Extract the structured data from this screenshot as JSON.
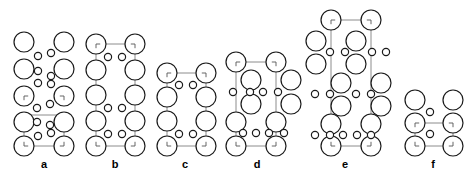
{
  "figure": {
    "kind": "crystal-structure-panels",
    "background_color": "#ffffff",
    "atom_outline_color": "#1a1a1a",
    "atom_fill_color": "#ffffff",
    "cell_edge_color": "#8c8c8c",
    "large_atom_radius": 10,
    "medium_atom_radius": 9,
    "small_atom_radius": 3.6,
    "corner_tick_color": "#555555",
    "panels": [
      {
        "id": "a",
        "label": "a",
        "label_x": 44,
        "label_y": 168,
        "cell_corners": [
          [
            24,
            115
          ],
          [
            64,
            115
          ],
          [
            24,
            146
          ],
          [
            64,
            146
          ]
        ],
        "cell_edges": [
          [
            24,
            115,
            64,
            115
          ],
          [
            24,
            146,
            64,
            146
          ],
          [
            24,
            115,
            24,
            146
          ],
          [
            64,
            115,
            64,
            146
          ]
        ],
        "large_atoms": [
          [
            24,
            42
          ],
          [
            64,
            42
          ],
          [
            24,
            69
          ],
          [
            64,
            69
          ],
          [
            24,
            96
          ],
          [
            64,
            96
          ],
          [
            24,
            122
          ],
          [
            64,
            122
          ],
          [
            24,
            146
          ],
          [
            64,
            146
          ]
        ],
        "small_atoms": [
          [
            38,
            56
          ],
          [
            51,
            53
          ],
          [
            38,
            71
          ],
          [
            51,
            76
          ],
          [
            38,
            83
          ],
          [
            51,
            84
          ],
          [
            37,
            108
          ],
          [
            50,
            104
          ],
          [
            37,
            122
          ],
          [
            50,
            125
          ],
          [
            38,
            136
          ],
          [
            51,
            133
          ]
        ],
        "corner_atoms": [
          [
            24,
            96
          ],
          [
            64,
            96
          ],
          [
            24,
            146
          ],
          [
            64,
            146
          ]
        ]
      },
      {
        "id": "b",
        "label": "b",
        "label_x": 115,
        "label_y": 168,
        "cell_corners": [
          [
            96,
            44
          ],
          [
            135,
            44
          ],
          [
            96,
            146
          ],
          [
            135,
            146
          ]
        ],
        "cell_edges": [
          [
            96,
            44,
            135,
            44
          ],
          [
            96,
            146,
            135,
            146
          ],
          [
            96,
            44,
            96,
            146
          ],
          [
            135,
            44,
            135,
            146
          ]
        ],
        "large_atoms": [
          [
            96,
            44
          ],
          [
            135,
            44
          ],
          [
            96,
            70
          ],
          [
            135,
            70
          ],
          [
            96,
            95
          ],
          [
            135,
            95
          ],
          [
            96,
            121
          ],
          [
            135,
            121
          ],
          [
            96,
            146
          ],
          [
            135,
            146
          ]
        ],
        "small_atoms": [
          [
            108,
            57
          ],
          [
            122,
            57
          ],
          [
            108,
            108
          ],
          [
            122,
            108
          ],
          [
            108,
            134
          ],
          [
            122,
            134
          ]
        ],
        "corner_atoms": [
          [
            96,
            44
          ],
          [
            135,
            44
          ],
          [
            96,
            146
          ],
          [
            135,
            146
          ]
        ]
      },
      {
        "id": "c",
        "label": "c",
        "label_x": 185,
        "label_y": 168,
        "cell_corners": [
          [
            167,
            73
          ],
          [
            206,
            73
          ],
          [
            167,
            146
          ],
          [
            206,
            146
          ]
        ],
        "cell_edges": [
          [
            167,
            73,
            206,
            73
          ],
          [
            167,
            146,
            206,
            146
          ],
          [
            167,
            73,
            167,
            146
          ],
          [
            206,
            73,
            206,
            146
          ]
        ],
        "large_atoms": [
          [
            167,
            73
          ],
          [
            206,
            73
          ],
          [
            167,
            97
          ],
          [
            206,
            97
          ],
          [
            167,
            121
          ],
          [
            206,
            121
          ],
          [
            167,
            146
          ],
          [
            206,
            146
          ]
        ],
        "small_atoms": [
          [
            179,
            85
          ],
          [
            193,
            85
          ],
          [
            179,
            134
          ],
          [
            193,
            134
          ]
        ],
        "corner_atoms": [
          [
            167,
            73
          ],
          [
            206,
            73
          ],
          [
            167,
            146
          ],
          [
            206,
            146
          ]
        ]
      },
      {
        "id": "d",
        "label": "d",
        "label_x": 257,
        "label_y": 168,
        "cell_corners": [
          [
            236,
            62
          ],
          [
            276,
            62
          ],
          [
            236,
            146
          ],
          [
            276,
            146
          ]
        ],
        "cell_edges": [
          [
            236,
            62,
            276,
            62
          ],
          [
            236,
            146,
            276,
            146
          ],
          [
            236,
            62,
            236,
            146
          ],
          [
            276,
            62,
            276,
            146
          ]
        ],
        "large_atoms": [
          [
            236,
            62
          ],
          [
            276,
            62
          ],
          [
            251,
            80
          ],
          [
            291,
            80
          ],
          [
            251,
            104
          ],
          [
            291,
            104
          ],
          [
            236,
            122
          ],
          [
            276,
            122
          ],
          [
            236,
            146
          ],
          [
            276,
            146
          ]
        ],
        "small_atoms": [
          [
            233,
            92
          ],
          [
            250,
            92
          ],
          [
            263,
            92
          ],
          [
            278,
            92
          ],
          [
            243,
            133
          ],
          [
            256,
            133
          ],
          [
            269,
            133
          ],
          [
            284,
            133
          ]
        ],
        "corner_atoms": [
          [
            236,
            62
          ],
          [
            276,
            62
          ],
          [
            236,
            146
          ],
          [
            276,
            146
          ]
        ]
      },
      {
        "id": "e",
        "label": "e",
        "label_x": 345,
        "label_y": 168,
        "cell_corners": [
          [
            331,
            20
          ],
          [
            371,
            20
          ],
          [
            331,
            146
          ],
          [
            371,
            146
          ]
        ],
        "cell_edges": [
          [
            331,
            20,
            371,
            20
          ],
          [
            331,
            146,
            371,
            146
          ],
          [
            331,
            20,
            331,
            146
          ],
          [
            371,
            20,
            371,
            146
          ]
        ],
        "large_atoms": [
          [
            331,
            20
          ],
          [
            371,
            20
          ],
          [
            316,
            41
          ],
          [
            356,
            41
          ],
          [
            316,
            64
          ],
          [
            356,
            64
          ],
          [
            341,
            83
          ],
          [
            381,
            83
          ],
          [
            341,
            106
          ],
          [
            381,
            106
          ],
          [
            331,
            124
          ],
          [
            371,
            124
          ],
          [
            331,
            146
          ],
          [
            371,
            146
          ]
        ],
        "small_atoms": [
          [
            330,
            52
          ],
          [
            345,
            52
          ],
          [
            372,
            52
          ],
          [
            386,
            52
          ],
          [
            315,
            94
          ],
          [
            330,
            94
          ],
          [
            356,
            94
          ],
          [
            371,
            94
          ],
          [
            315,
            135
          ],
          [
            330,
            135
          ],
          [
            343,
            135
          ],
          [
            357,
            135
          ],
          [
            371,
            135
          ]
        ],
        "corner_atoms": [
          [
            331,
            20
          ],
          [
            371,
            20
          ],
          [
            331,
            146
          ],
          [
            371,
            146
          ]
        ]
      },
      {
        "id": "f",
        "label": "f",
        "label_x": 433,
        "label_y": 168,
        "cell_corners": [
          [
            415,
            123
          ],
          [
            453,
            123
          ],
          [
            415,
            146
          ],
          [
            453,
            146
          ]
        ],
        "cell_edges": [
          [
            415,
            123,
            453,
            123
          ],
          [
            415,
            146,
            453,
            146
          ],
          [
            415,
            123,
            415,
            146
          ],
          [
            453,
            123,
            453,
            146
          ]
        ],
        "large_atoms": [
          [
            415,
            100
          ],
          [
            453,
            100
          ],
          [
            415,
            123
          ],
          [
            453,
            123
          ],
          [
            415,
            146
          ],
          [
            453,
            146
          ]
        ],
        "small_atoms": [
          [
            430,
            112
          ],
          [
            430,
            134
          ]
        ],
        "corner_atoms": [
          [
            415,
            123
          ],
          [
            453,
            123
          ],
          [
            415,
            146
          ],
          [
            453,
            146
          ]
        ]
      }
    ]
  }
}
